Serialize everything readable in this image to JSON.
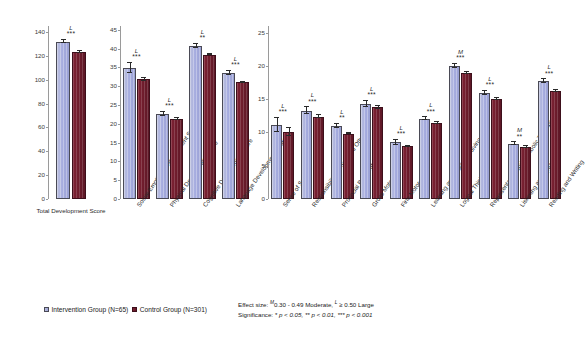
{
  "legend": {
    "intervention_label": "Intervention Group (N=65)",
    "control_label": "Control Group (N=301)",
    "intervention_color": "#a7ade0",
    "control_color": "#6e1c2c"
  },
  "notes": {
    "effect_size": "Effect size: ᴹ0.30 - 0.49 Moderate,  ᴸ ≥ 0.50 Large",
    "effect_size_prefix": "Effect size: ",
    "effect_size_m": "M",
    "effect_size_mid": "0.30 - 0.49 Moderate,  ",
    "effect_size_l": "L",
    "effect_size_end": " ≥ 0.50 Large",
    "significance_prefix": "Significance: ",
    "significance_body": "* p < 0.05, ** p < 0.01, *** p < 0.001"
  },
  "chart_data": [
    {
      "type": "bar",
      "panel": 1,
      "title": "",
      "xlabel": "",
      "ylabel": "",
      "ylim": [
        0,
        145
      ],
      "yticks": [
        0,
        20,
        40,
        60,
        80,
        100,
        120,
        140
      ],
      "grid": false,
      "legend_position": "bottom",
      "categories": [
        "Total Development Score"
      ],
      "series": [
        {
          "name": "Intervention Group (N=65)",
          "values": [
            132.0
          ],
          "errors": [
            1.6
          ]
        },
        {
          "name": "Control Group (N=301)",
          "values": [
            123.0
          ],
          "errors": [
            1.0
          ]
        }
      ],
      "annotations": [
        {
          "category": "Total Development Score",
          "effect_size": "L",
          "significance": "***"
        }
      ]
    },
    {
      "type": "bar",
      "panel": 2,
      "title": "",
      "xlabel": "",
      "ylabel": "",
      "ylim": [
        0,
        46
      ],
      "yticks": [
        0,
        5,
        10,
        15,
        20,
        25,
        30,
        35,
        40,
        45
      ],
      "grid": false,
      "legend_position": "bottom",
      "categories": [
        "Social-Emotional Development Score",
        "Physical Development Score",
        "Cognitive Development Score",
        "Language Development Score"
      ],
      "series": [
        {
          "name": "Intervention Group (N=65)",
          "values": [
            34.9,
            22.7,
            40.7,
            33.6
          ],
          "errors": [
            1.3,
            0.5,
            0.5,
            0.5
          ]
        },
        {
          "name": "Control Group (N=301)",
          "values": [
            31.9,
            21.3,
            38.4,
            31.0
          ],
          "errors": [
            0.4,
            0.2,
            0.2,
            0.2
          ]
        }
      ],
      "annotations": [
        {
          "category": "Social-Emotional Development Score",
          "effect_size": "L",
          "significance": "***"
        },
        {
          "category": "Physical Development Score",
          "effect_size": "L",
          "significance": "***"
        },
        {
          "category": "Cognitive Development Score",
          "effect_size": "L",
          "significance": "**"
        },
        {
          "category": "Language Development Score",
          "effect_size": "L",
          "significance": "***"
        }
      ]
    },
    {
      "type": "bar",
      "panel": 3,
      "title": "",
      "xlabel": "",
      "ylabel": "",
      "ylim": [
        0,
        26
      ],
      "yticks": [
        0,
        5,
        10,
        15,
        20,
        25
      ],
      "grid": false,
      "legend_position": "bottom",
      "categories": [
        "Sense of Self",
        "Responsibility for Self and Others",
        "Prosocial Behavior",
        "Gross Motor",
        "Fine Motor",
        "Learning and Problem Solving",
        "Logical Thinking",
        "Representation and Symbolic Thinking",
        "Listening and Speaking",
        "Reading and Writing"
      ],
      "series": [
        {
          "name": "Intervention Group (N=65)",
          "values": [
            11.1,
            13.3,
            11.0,
            14.3,
            8.5,
            12.1,
            20.0,
            16.0,
            8.3,
            17.7
          ],
          "errors": [
            1.1,
            0.5,
            0.3,
            0.5,
            0.4,
            0.2,
            0.3,
            0.3,
            0.2,
            0.3
          ]
        },
        {
          "name": "Control Group (N=301)",
          "values": [
            10.0,
            12.4,
            9.8,
            13.8,
            7.9,
            11.4,
            19.0,
            15.0,
            7.8,
            16.2
          ],
          "errors": [
            0.6,
            0.2,
            0.1,
            0.2,
            0.1,
            0.1,
            0.15,
            0.15,
            0.1,
            0.15
          ]
        }
      ],
      "annotations": [
        {
          "category": "Sense of Self",
          "effect_size": "L",
          "significance": "***"
        },
        {
          "category": "Responsibility for Self and Others",
          "effect_size": "L",
          "significance": "***"
        },
        {
          "category": "Prosocial Behavior",
          "effect_size": "L",
          "significance": "**"
        },
        {
          "category": "Gross Motor",
          "effect_size": "L",
          "significance": "***"
        },
        {
          "category": "Fine Motor",
          "effect_size": "L",
          "significance": "***"
        },
        {
          "category": "Learning and Problem Solving",
          "effect_size": "L",
          "significance": "***"
        },
        {
          "category": "Logical Thinking",
          "effect_size": "M",
          "significance": "***"
        },
        {
          "category": "Representation and Symbolic Thinking",
          "effect_size": "L",
          "significance": "***"
        },
        {
          "category": "Listening and Speaking",
          "effect_size": "M",
          "significance": "**"
        },
        {
          "category": "Reading and Writing",
          "effect_size": "L",
          "significance": "***"
        }
      ]
    }
  ]
}
